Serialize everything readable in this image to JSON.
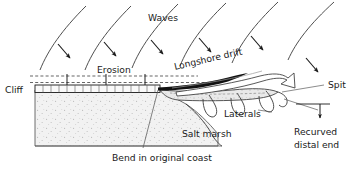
{
  "diagram": {
    "background_color": "#ffffff",
    "line_color": "#1a1a1a",
    "sediment_fill": "#f0f0f0",
    "spit_fill": "#e6e6e6",
    "stipple_color": "#b0b0b0"
  },
  "labels": {
    "waves": "Waves",
    "erosion": "Erosion",
    "longshore_drift": "Longshore drift",
    "cliff": "Cliff",
    "spit": "Spit",
    "laterals": "Laterals",
    "recurved_distal_end_line1": "Recurved",
    "recurved_distal_end_line2": "distal end",
    "salt_marsh": "Salt marsh",
    "bend_in_original_coast": "Bend in original coast"
  },
  "features": {
    "wave_crests": 6,
    "wave_arrows": 6,
    "erosion_lines": 2,
    "erosion_arrows": 3,
    "laterals_count": 3,
    "drift_arrow_style": "solid-black-tapered",
    "recurve_arrow_style": "hollow-outline"
  }
}
